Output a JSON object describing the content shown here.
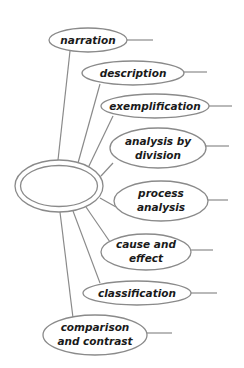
{
  "diagram": {
    "type": "cluster-map",
    "colors": {
      "line": "#8a8a8a",
      "text": "#1a1a1a",
      "background": "#ffffff"
    },
    "center": {
      "label": "",
      "shape": "double-ellipse"
    },
    "nodes": [
      {
        "id": "narration",
        "lines": [
          "narration"
        ]
      },
      {
        "id": "description",
        "lines": [
          "description"
        ]
      },
      {
        "id": "exemplification",
        "lines": [
          "exemplification"
        ]
      },
      {
        "id": "analysis-by-division",
        "lines": [
          "analysis by",
          "division"
        ]
      },
      {
        "id": "process-analysis",
        "lines": [
          "process",
          "analysis"
        ]
      },
      {
        "id": "cause-and-effect",
        "lines": [
          "cause and",
          "effect"
        ]
      },
      {
        "id": "classification",
        "lines": [
          "classification"
        ]
      },
      {
        "id": "comparison-and-contrast",
        "lines": [
          "comparison",
          "and contrast"
        ]
      }
    ]
  }
}
